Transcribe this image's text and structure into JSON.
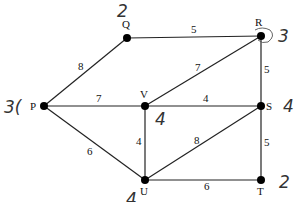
{
  "graph": {
    "nodes": [
      {
        "id": "Q",
        "x": 127,
        "y": 38,
        "label": "Q",
        "lx": 122,
        "ly": 28
      },
      {
        "id": "R",
        "x": 261,
        "y": 36,
        "label": "R",
        "lx": 255,
        "ly": 26
      },
      {
        "id": "P",
        "x": 44,
        "y": 106,
        "label": "P",
        "lx": 30,
        "ly": 110
      },
      {
        "id": "V",
        "x": 145,
        "y": 106,
        "label": "V",
        "lx": 140,
        "ly": 98
      },
      {
        "id": "S",
        "x": 261,
        "y": 106,
        "label": "S",
        "lx": 266,
        "ly": 110
      },
      {
        "id": "U",
        "x": 145,
        "y": 180,
        "label": "U",
        "lx": 140,
        "ly": 195
      },
      {
        "id": "T",
        "x": 261,
        "y": 180,
        "label": "T",
        "lx": 257,
        "ly": 195
      }
    ],
    "edges": [
      {
        "from": "P",
        "to": "Q",
        "weight": "8",
        "wx": 78,
        "wy": 70
      },
      {
        "from": "Q",
        "to": "R",
        "weight": "5",
        "wx": 191,
        "wy": 33
      },
      {
        "from": "P",
        "to": "V",
        "weight": "7",
        "wx": 96,
        "wy": 102
      },
      {
        "from": "V",
        "to": "R",
        "weight": "7",
        "wx": 195,
        "wy": 71
      },
      {
        "from": "V",
        "to": "S",
        "weight": "4",
        "wx": 203,
        "wy": 102
      },
      {
        "from": "R",
        "to": "S",
        "weight": "5",
        "wx": 264,
        "wy": 73
      },
      {
        "from": "P",
        "to": "U",
        "weight": "6",
        "wx": 87,
        "wy": 155
      },
      {
        "from": "V",
        "to": "U",
        "weight": "4",
        "wx": 136,
        "wy": 145
      },
      {
        "from": "U",
        "to": "S",
        "weight": "8",
        "wx": 194,
        "wy": 144
      },
      {
        "from": "U",
        "to": "T",
        "weight": "6",
        "wx": 204,
        "wy": 190
      },
      {
        "from": "S",
        "to": "T",
        "weight": "5",
        "wx": 264,
        "wy": 146
      }
    ],
    "annotations": [
      {
        "text": "2",
        "x": 117,
        "y": 17,
        "near": "Q"
      },
      {
        "text": "3",
        "x": 278,
        "y": 42,
        "near": "R"
      },
      {
        "text": "3(",
        "x": 4,
        "y": 113,
        "near": "P"
      },
      {
        "text": "4",
        "x": 283,
        "y": 112,
        "near": "S"
      },
      {
        "text": "4",
        "x": 155,
        "y": 125,
        "near": "V"
      },
      {
        "text": "2",
        "x": 279,
        "y": 188,
        "near": "T"
      },
      {
        "text": "4",
        "x": 126,
        "y": 205,
        "near": "U"
      }
    ]
  }
}
